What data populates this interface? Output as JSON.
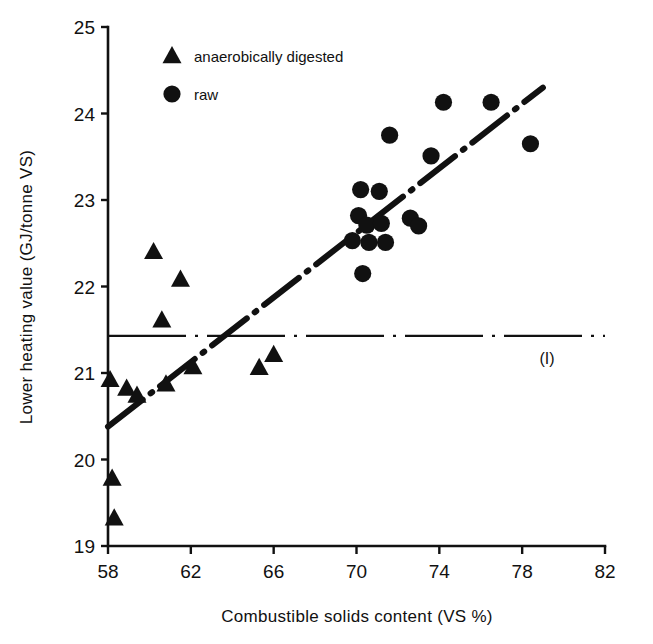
{
  "chart_data": {
    "type": "scatter",
    "title": "",
    "xlabel": "Combustible solids content (VS %)",
    "ylabel": "Lower heating value (GJ/tonne VS)",
    "xlim": [
      58,
      82
    ],
    "ylim": [
      19,
      25
    ],
    "xticks": [
      "58",
      "62",
      "66",
      "70",
      "74",
      "78",
      "82"
    ],
    "xtick_values": [
      58,
      62,
      66,
      70,
      74,
      78,
      82
    ],
    "yticks": [
      "19",
      "20",
      "21",
      "22",
      "23",
      "24",
      "25"
    ],
    "ytick_values": [
      19,
      20,
      21,
      22,
      23,
      24,
      25
    ],
    "grid": false,
    "legend_position": "top-left",
    "series": [
      {
        "name": "anaerobically digested",
        "marker": "triangle",
        "color": "#111111",
        "points": [
          [
            58.1,
            20.92
          ],
          [
            58.2,
            19.78
          ],
          [
            58.3,
            19.32
          ],
          [
            58.9,
            20.82
          ],
          [
            59.4,
            20.74
          ],
          [
            60.2,
            22.4
          ],
          [
            60.6,
            21.61
          ],
          [
            60.8,
            20.87
          ],
          [
            61.5,
            22.08
          ],
          [
            62.1,
            21.07
          ],
          [
            65.3,
            21.06
          ],
          [
            66.0,
            21.21
          ]
        ]
      },
      {
        "name": "raw",
        "marker": "circle",
        "color": "#111111",
        "points": [
          [
            69.8,
            22.53
          ],
          [
            70.1,
            22.82
          ],
          [
            70.2,
            23.12
          ],
          [
            70.3,
            22.15
          ],
          [
            70.5,
            22.71
          ],
          [
            70.6,
            22.51
          ],
          [
            71.1,
            23.1
          ],
          [
            71.2,
            22.73
          ],
          [
            71.4,
            22.51
          ],
          [
            71.6,
            23.75
          ],
          [
            72.6,
            22.79
          ],
          [
            73.0,
            22.7
          ],
          [
            73.6,
            23.51
          ],
          [
            74.2,
            24.13
          ],
          [
            76.5,
            24.13
          ],
          [
            78.4,
            23.65
          ]
        ]
      }
    ],
    "trend_line": {
      "name": "regression",
      "style": "dash-dot",
      "from": [
        58.0,
        20.38
      ],
      "to": [
        79.0,
        24.3
      ]
    },
    "reference_line": {
      "name": "reference",
      "label": "(I)",
      "style": "dash-dot",
      "orientation": "horizontal",
      "y": 21.43,
      "x_from": 58.0,
      "x_to": 82.0
    },
    "annotations": [
      {
        "text": "(I)",
        "x": 79.2,
        "y": 21.1
      }
    ],
    "legend": [
      {
        "label": "anaerobically digested",
        "marker": "triangle"
      },
      {
        "label": "raw",
        "marker": "circle"
      }
    ]
  }
}
